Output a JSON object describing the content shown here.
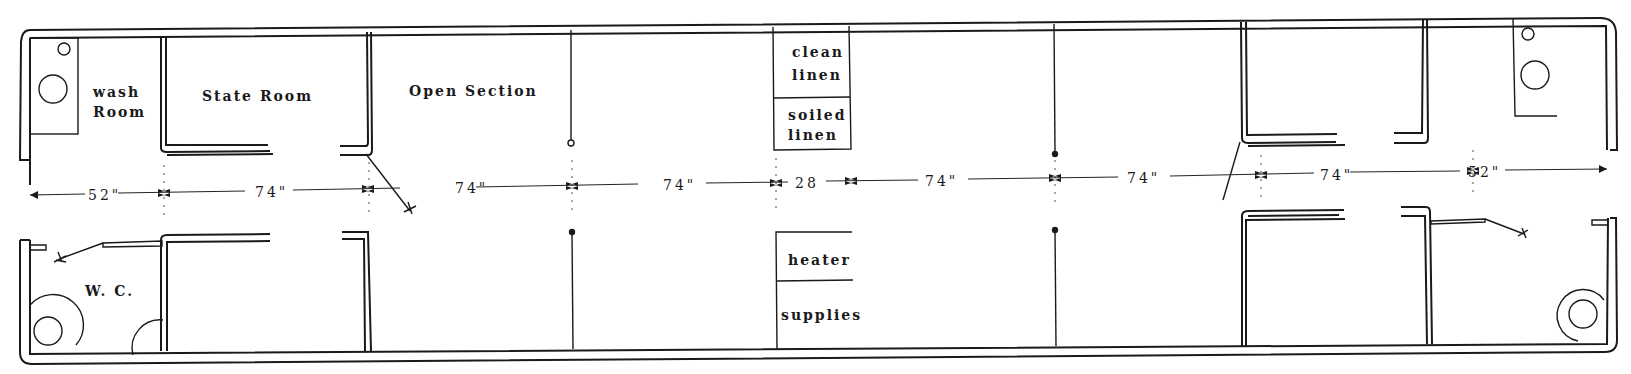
{
  "diagram": {
    "type": "floor-plan",
    "rooms": {
      "wash_room": "wash\nRoom",
      "wash_room_line1": "wash",
      "wash_room_line2": "Room",
      "state_room": "State Room",
      "open_section": "Open Section",
      "clean_linen_line1": "clean",
      "clean_linen_line2": "linen",
      "soiled_linen_line1": "soiled",
      "soiled_linen_line2": "linen",
      "heater": "heater",
      "supplies": "supplies",
      "wc": "W. C."
    },
    "dimensions": [
      {
        "id": "d1",
        "label": "52\""
      },
      {
        "id": "d2",
        "label": "74\""
      },
      {
        "id": "d3",
        "label": "74\""
      },
      {
        "id": "d4",
        "label": "74\""
      },
      {
        "id": "d5",
        "label": "28"
      },
      {
        "id": "d6",
        "label": "74\""
      },
      {
        "id": "d7",
        "label": "74\""
      },
      {
        "id": "d8",
        "label": "74\""
      },
      {
        "id": "d9",
        "label": "52\""
      }
    ],
    "colors": {
      "line": "#1a1a1a",
      "background": "#ffffff"
    }
  }
}
